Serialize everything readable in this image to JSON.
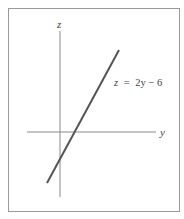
{
  "figure": {
    "axes": {
      "vertical_label": "z",
      "horizontal_label": "y"
    },
    "line": {
      "equation_lhs": "z",
      "equation_eq": "=",
      "equation_rhs": "2y − 6",
      "equation_full": "z = 2y − 6",
      "slope": 2,
      "intercept": -6
    },
    "colors": {
      "axis": "#8a8a8a",
      "line": "#555555",
      "frame": "#9a9a9a",
      "text": "#444444"
    }
  }
}
